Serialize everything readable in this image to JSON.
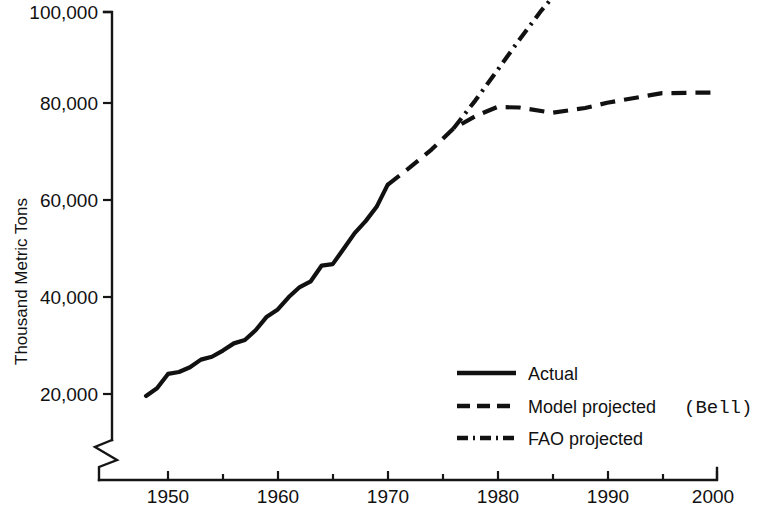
{
  "chart_data": {
    "type": "line",
    "title": "",
    "xlabel": "",
    "ylabel": "Thousand Metric Tons",
    "xlim": [
      1945,
      2000
    ],
    "ylim": [
      14000,
      103000
    ],
    "grid": false,
    "axis_break": true,
    "legend_position": "lower-right",
    "x_ticks_major": [
      1950,
      1960,
      1970,
      1980,
      1990,
      2000
    ],
    "x_ticks_minor": [
      1955,
      1965,
      1975,
      1985,
      1995
    ],
    "x_tick_labels": [
      "1950",
      "1960",
      "1970",
      "1980",
      "1990",
      "2000"
    ],
    "y_ticks": [
      20000,
      40000,
      60000,
      80000,
      100000
    ],
    "y_tick_labels": [
      "20,000",
      "40,000",
      "60,000",
      "80,000",
      "100,000"
    ],
    "series": [
      {
        "name": "Actual",
        "style": "solid",
        "x": [
          1948,
          1949,
          1950,
          1951,
          1952,
          1953,
          1954,
          1955,
          1956,
          1957,
          1958,
          1959,
          1960,
          1961,
          1962,
          1963,
          1964,
          1965,
          1966,
          1967,
          1968,
          1969,
          1970
        ],
        "values": [
          19600,
          21200,
          24200,
          24600,
          25600,
          27200,
          27800,
          29100,
          30600,
          31300,
          33400,
          36200,
          37700,
          40300,
          42400,
          43600,
          46900,
          47200,
          50400,
          53700,
          56200,
          59200,
          63800
        ]
      },
      {
        "name": "Model projected",
        "note": "(Bell)",
        "style": "dashed",
        "x": [
          1970,
          1972,
          1974,
          1976,
          1978,
          1980,
          1982,
          1985,
          1988,
          1990,
          1993,
          1995,
          1998,
          2000
        ],
        "values": [
          63800,
          67400,
          71200,
          75600,
          78200,
          80100,
          80000,
          78900,
          79900,
          81000,
          82200,
          83000,
          83100,
          83100
        ]
      },
      {
        "name": "FAO projected",
        "style": "dash-dot",
        "x": [
          1976,
          1978,
          1980,
          1982,
          1984,
          1985
        ],
        "values": [
          75600,
          81500,
          87800,
          94200,
          100300,
          103000
        ]
      }
    ]
  },
  "legend": {
    "items": [
      {
        "label": "Actual",
        "note": ""
      },
      {
        "label": "Model projected",
        "note": "(Bell)"
      },
      {
        "label": "FAO projected",
        "note": ""
      }
    ]
  },
  "axis": {
    "y_label": "Thousand Metric Tons"
  }
}
